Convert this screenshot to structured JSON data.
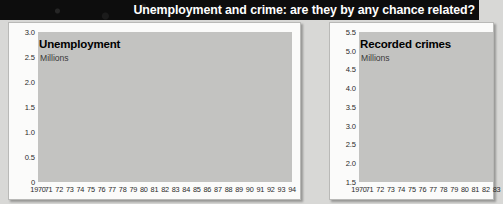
{
  "headline": "Unemployment and crime: are they by any chance related?",
  "colors": {
    "headline_bg": "#0d0d0d",
    "headline_text": "#ffffff",
    "page_bg": "#d8d8d6",
    "panel_bg": "#fbfbfa",
    "plot_bg": "#c3c3c1",
    "area_fill": "#9d9d9b",
    "gridline": "#ffffff",
    "line": "#000000"
  },
  "chart_data": [
    {
      "type": "area",
      "panel": "left",
      "title": "Unemployment",
      "subtitle": "Millions",
      "xlabel": "",
      "ylabel": "Millions",
      "ylim": [
        0,
        3.0
      ],
      "yticks": [
        "3.0",
        "2.5",
        "2.0",
        "1.5",
        "1.0",
        "0.5",
        "0"
      ],
      "ytick_values": [
        3.0,
        2.5,
        2.0,
        1.5,
        1.0,
        0.5,
        0
      ],
      "grid": true,
      "legend": "none",
      "categories": [
        "1970",
        "71",
        "72",
        "73",
        "74",
        "75",
        "76",
        "77",
        "78",
        "79",
        "80",
        "81",
        "82",
        "83",
        "84",
        "85",
        "86",
        "87",
        "88",
        "89",
        "90",
        "91",
        "92",
        "93",
        "94"
      ],
      "values": [
        0.4,
        0.6,
        0.52,
        0.32,
        0.46,
        0.72,
        0.92,
        1.05,
        0.97,
        0.85,
        1.25,
        2.05,
        2.2,
        2.37,
        2.45,
        2.52,
        2.6,
        2.45,
        1.95,
        1.5,
        1.25,
        1.7,
        2.2,
        2.55,
        2.5
      ]
    },
    {
      "type": "area",
      "panel": "right",
      "title": "Recorded crimes",
      "subtitle": "Millions",
      "xlabel": "",
      "ylabel": "Millions",
      "ylim": [
        1.5,
        5.5
      ],
      "yticks": [
        "5.5",
        "5.0",
        "4.5",
        "4.0",
        "3.5",
        "3.0",
        "2.5",
        "2.0",
        "1.5"
      ],
      "ytick_values": [
        5.5,
        5.0,
        4.5,
        4.0,
        3.5,
        3.0,
        2.5,
        2.0,
        1.5
      ],
      "grid": true,
      "legend": "none",
      "note": "right chart is cropped at the image edge after 1983",
      "categories": [
        "1970",
        "71",
        "72",
        "73",
        "74",
        "75",
        "76",
        "77",
        "78",
        "79",
        "80",
        "81",
        "82",
        "83"
      ],
      "values": [
        1.63,
        1.67,
        1.62,
        1.95,
        2.05,
        2.15,
        2.05,
        2.45,
        2.35,
        2.4,
        2.65,
        2.9,
        3.1,
        3.25
      ]
    }
  ]
}
